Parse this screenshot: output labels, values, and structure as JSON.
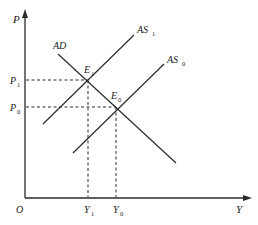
{
  "diagram": {
    "type": "AD-AS model",
    "colors": {
      "line": "#2a2a2a",
      "background": "#ffffff"
    },
    "axes": {
      "y_label": "P",
      "x_label": "Y",
      "origin_label": "O"
    },
    "curves": {
      "ad": {
        "label": "AD"
      },
      "as1": {
        "label": "AS",
        "sub": "1"
      },
      "as0": {
        "label": "AS",
        "sub": "0"
      }
    },
    "points": {
      "e1": {
        "label": "E",
        "sub": "1"
      },
      "e0": {
        "label": "E",
        "sub": "0"
      }
    },
    "ticks": {
      "p1": {
        "label": "P",
        "sub": "1"
      },
      "p0": {
        "label": "P",
        "sub": "0"
      },
      "y1": {
        "label": "Y",
        "sub": "1"
      },
      "y0": {
        "label": "Y",
        "sub": "0"
      }
    }
  }
}
